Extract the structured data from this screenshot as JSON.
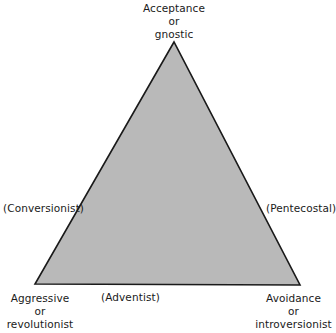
{
  "diagram": {
    "type": "triangle",
    "fill_color": "#b9b9b9",
    "stroke_color": "#1a1a1a",
    "vertices": {
      "top": {
        "lines": [
          "Acceptance",
          "or",
          "gnostic"
        ]
      },
      "bottom_left": {
        "lines": [
          "Aggressive",
          "or",
          "revolutionist"
        ]
      },
      "bottom_right": {
        "lines": [
          "Avoidance",
          "or",
          "introversionist"
        ]
      }
    },
    "edges": {
      "left": "(Conversionist)",
      "right": "(Pentecostal)",
      "bottom": "(Adventist)"
    }
  }
}
